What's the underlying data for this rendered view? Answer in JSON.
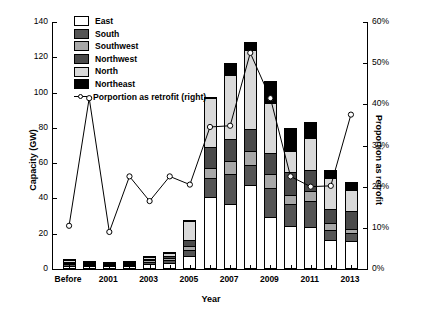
{
  "chart_data": {
    "type": "bar",
    "title": "",
    "xlabel": "Year",
    "ylabel": "Capacity (GW)",
    "ylabel_right": "Proportion as retrofit",
    "ylim": [
      0,
      140
    ],
    "ylim_right": [
      0,
      60
    ],
    "yticks": [
      0,
      20,
      40,
      60,
      80,
      100,
      120,
      140
    ],
    "yticks_right": [
      "0%",
      "10%",
      "20%",
      "30%",
      "40%",
      "50%",
      "60%"
    ],
    "grid": false,
    "legend_position": "top-left",
    "stacked": true,
    "categories": [
      "Before",
      "2000",
      "2001",
      "2002",
      "2003",
      "2004",
      "2005",
      "2006",
      "2007",
      "2008",
      "2009",
      "2010",
      "2011",
      "2012",
      "2013"
    ],
    "xtick_labels": [
      "Before",
      "",
      "2001",
      "",
      "2003",
      "",
      "2005",
      "",
      "2007",
      "",
      "2009",
      "",
      "2011",
      "",
      "2013"
    ],
    "series": [
      {
        "name": "East",
        "color": "#ffffff",
        "values": [
          0.8,
          0.6,
          0.3,
          0.5,
          1.5,
          2.0,
          6.5,
          39.5,
          36.0,
          46.5,
          28.5,
          23.0,
          22.5,
          15.5,
          14.5
        ]
      },
      {
        "name": "South",
        "color": "#555555",
        "values": [
          1.0,
          0.4,
          0.2,
          0.4,
          1.5,
          2.0,
          3.0,
          11.0,
          16.5,
          11.5,
          16.5,
          12.5,
          15.0,
          5.5,
          5.0
        ]
      },
      {
        "name": "Southwest",
        "color": "#a8a8a8",
        "values": [
          0.6,
          0.3,
          0.2,
          0.3,
          0.8,
          1.0,
          2.5,
          5.5,
          7.5,
          7.5,
          7.5,
          5.5,
          5.5,
          4.0,
          2.0
        ]
      },
      {
        "name": "Northwest",
        "color": "#4a4a4a",
        "values": [
          0.6,
          0.3,
          0.2,
          0.3,
          0.9,
          1.2,
          3.5,
          12.0,
          12.5,
          13.0,
          12.0,
          13.0,
          12.0,
          8.0,
          10.5
        ]
      },
      {
        "name": "North",
        "color": "#d9d9d9",
        "values": [
          0.8,
          0.3,
          0.2,
          0.3,
          0.8,
          1.8,
          10.5,
          28.0,
          36.5,
          44.5,
          28.5,
          12.0,
          18.0,
          17.5,
          11.5
        ]
      },
      {
        "name": "Northeast",
        "color": "#000000",
        "values": [
          0.2,
          0.1,
          0.0,
          0.1,
          0.5,
          0.5,
          0.5,
          0.5,
          6.5,
          4.5,
          12.5,
          13.0,
          9.0,
          4.5,
          4.5
        ]
      }
    ],
    "line_series": {
      "name": "Porportion as retrofit (right)",
      "axis": "right",
      "marker": "open-circle",
      "values": [
        10.5,
        41.5,
        9.0,
        22.5,
        16.5,
        22.5,
        20.5,
        34.5,
        34.8,
        52.5,
        41.5,
        22.5,
        20.0,
        20.2,
        37.5
      ]
    }
  },
  "legend": {
    "items": [
      {
        "label": "East"
      },
      {
        "label": "South"
      },
      {
        "label": "Southwest"
      },
      {
        "label": "Northwest"
      },
      {
        "label": "North"
      },
      {
        "label": "Northeast"
      },
      {
        "label": "Porportion as retrofit (right)"
      }
    ]
  }
}
